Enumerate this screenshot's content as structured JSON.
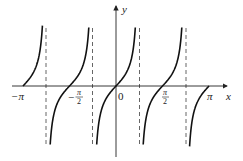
{
  "chart_data": {
    "type": "line",
    "title": "",
    "function": "y = tan(2x)",
    "xlabel": "x",
    "ylabel": "y",
    "xlim": [
      -3.1416,
      3.1416
    ],
    "x_ticks": [
      {
        "value": -3.1416,
        "label": "−π"
      },
      {
        "value": -1.5708,
        "label": "−π/2",
        "numerator": "π",
        "denominator": "2",
        "sign": "−"
      },
      {
        "value": 0,
        "label": "0"
      },
      {
        "value": 1.5708,
        "label": "π/2",
        "numerator": "π",
        "denominator": "2"
      },
      {
        "value": 3.1416,
        "label": "π"
      }
    ],
    "asymptotes": [
      -2.3562,
      -0.7854,
      0.7854,
      2.3562
    ],
    "zeros": [
      -3.1416,
      -1.5708,
      0,
      1.5708,
      3.1416
    ],
    "grid": false,
    "legend": null,
    "colors": {
      "curve": "#111111",
      "axis": "#222222",
      "asymptote": "#555555"
    }
  },
  "labels": {
    "x_axis": "x",
    "y_axis": "y",
    "origin": "0",
    "neg_pi": "−π",
    "neg_half_pi_sign": "−",
    "half_pi_num": "π",
    "half_pi_den": "2",
    "pi": "π"
  }
}
